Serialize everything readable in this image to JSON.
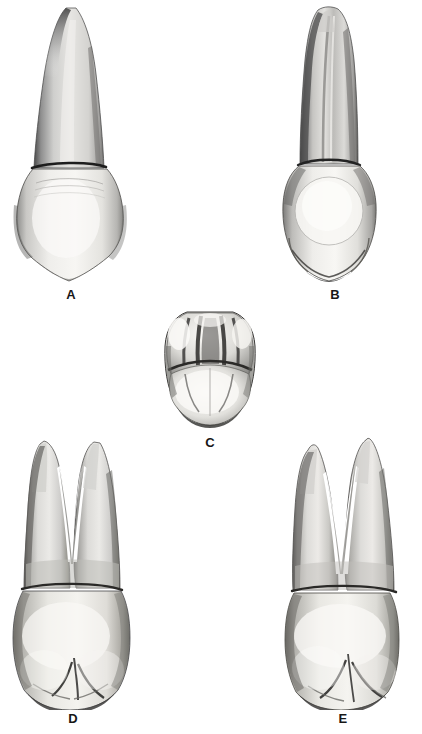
{
  "figure": {
    "kind": "dental-anatomy-plate",
    "background_color": "#ffffff",
    "ink_color": "#171717",
    "render_style": "grayscale halftone photograph",
    "width": 422,
    "height": 734
  },
  "panels": [
    {
      "id": "a",
      "label": "A",
      "view": "buccal",
      "description": "Single tapered conical root with broad trapezoidal crown and pointed buccal cusp",
      "roots": 1,
      "cusps": 1
    },
    {
      "id": "b",
      "label": "B",
      "view": "mesial",
      "description": "Slender root with developmental groove; bulbous rounded crown with cervical ridge",
      "roots": 1,
      "cusps": 1
    },
    {
      "id": "c",
      "label": "C",
      "view": "occlusal",
      "description": "Hexagonal occlusal outline with central developmental groove, mesial and distal marginal ridges, buccal and lingual cusps",
      "roots": 0,
      "cusps": 2
    },
    {
      "id": "d",
      "label": "D",
      "view": "distal",
      "description": "Bifurcated root with buccal and lingual branches divided by a deep V notch; crown shows two cusps",
      "roots": 2,
      "cusps": 2
    },
    {
      "id": "e",
      "label": "E",
      "view": "lingual",
      "description": "Bifurcated root with two pointed branches; crown with rounded lingual cusp and marginal groove",
      "roots": 2,
      "cusps": 2
    }
  ],
  "labels": {
    "a": "A",
    "b": "B",
    "c": "C",
    "d": "D",
    "e": "E"
  }
}
